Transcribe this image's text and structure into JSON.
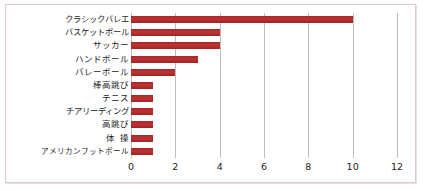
{
  "chart_data": {
    "type": "bar",
    "orientation": "horizontal",
    "title": "",
    "subtitle": "",
    "xlabel": "",
    "ylabel": "",
    "categories": [
      "クラシックバレエ",
      "バスケットボール",
      "サッカー",
      "ハンドボール",
      "バレーボール",
      "棒高跳び",
      "テニス",
      "チアリーディング",
      "高跳び",
      "体操",
      "アメリカンフットボール"
    ],
    "values": [
      10,
      4,
      4,
      3,
      2,
      1,
      1,
      1,
      1,
      1,
      1
    ],
    "xlim": [
      0,
      12
    ],
    "xticks": [
      0,
      2,
      4,
      6,
      8,
      10,
      12
    ],
    "xtick_labels": [
      "0",
      "2",
      "4",
      "6",
      "8",
      "10",
      "12"
    ],
    "grid": true,
    "grid_axis": "x",
    "legend": false,
    "legend_position": "none",
    "bar_color": "#b02a2a",
    "gridline_color": "#bdbdbd",
    "frame_color": "#dfc9cc",
    "background_color": "#ffffff",
    "text_color": "#1d1d1d"
  }
}
